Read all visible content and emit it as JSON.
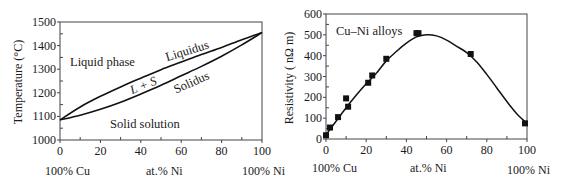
{
  "chart_data": [
    {
      "type": "line",
      "title": "Cu-Ni phase diagram",
      "xlabel": "at.% Ni",
      "ylabel": "Temperature (°C)",
      "x_end_labels": {
        "left": "100% Cu",
        "right": "100% Ni"
      },
      "xlim": [
        0,
        100
      ],
      "ylim": [
        1000,
        1500
      ],
      "x_ticks": [
        "0",
        "20",
        "40",
        "60",
        "80",
        "100"
      ],
      "y_ticks": [
        "1000",
        "1100",
        "1200",
        "1300",
        "1400",
        "1500"
      ],
      "grid": false,
      "region_labels": {
        "liquid": "Liquid phase",
        "solid": "Solid solution",
        "two_phase": "L + S",
        "liquidus": "Liquidus",
        "solidus": "Solidus"
      },
      "series": [
        {
          "name": "Liquidus",
          "x": [
            0,
            10,
            20,
            30,
            40,
            50,
            60,
            70,
            80,
            90,
            100
          ],
          "values": [
            1085,
            1140,
            1185,
            1225,
            1262,
            1298,
            1330,
            1362,
            1392,
            1425,
            1455
          ]
        },
        {
          "name": "Solidus",
          "x": [
            0,
            10,
            20,
            30,
            40,
            50,
            60,
            70,
            80,
            90,
            100
          ],
          "values": [
            1085,
            1105,
            1130,
            1160,
            1195,
            1232,
            1272,
            1312,
            1355,
            1403,
            1455
          ]
        }
      ]
    },
    {
      "type": "scatter",
      "title": "Cu–Ni alloys",
      "xlabel": "at.% Ni",
      "ylabel": "Resistivity ( nΩ m)",
      "x_end_labels": {
        "left": "100% Cu",
        "right": "100% Ni"
      },
      "xlim": [
        0,
        100
      ],
      "ylim": [
        0,
        600
      ],
      "x_ticks": [
        "0",
        "20",
        "40",
        "60",
        "80",
        "100"
      ],
      "y_ticks": [
        "0",
        "100",
        "200",
        "300",
        "400",
        "500",
        "600"
      ],
      "grid": false,
      "legend_text": "Cu–Ni alloys",
      "series": [
        {
          "name": "Measured",
          "x": [
            0,
            2,
            6,
            10,
            11,
            21,
            23,
            30,
            45,
            46,
            72,
            99
          ],
          "values": [
            18,
            55,
            105,
            195,
            155,
            270,
            305,
            385,
            508,
            508,
            408,
            75
          ]
        },
        {
          "name": "Fit curve",
          "x": [
            0,
            5,
            10,
            15,
            20,
            25,
            30,
            35,
            40,
            45,
            50,
            55,
            60,
            65,
            70,
            75,
            80,
            85,
            90,
            95,
            100
          ],
          "values": [
            20,
            85,
            150,
            210,
            265,
            315,
            375,
            420,
            460,
            490,
            500,
            495,
            475,
            445,
            415,
            370,
            310,
            245,
            180,
            120,
            75
          ]
        }
      ]
    }
  ]
}
